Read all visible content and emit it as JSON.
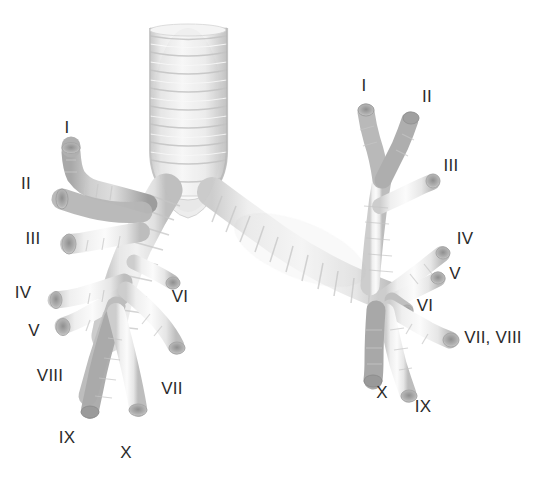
{
  "figure": {
    "kind": "anatomical-illustration",
    "background_color": "#ffffff",
    "label_color": "#2b2b2b",
    "airway_light": "#fdfdfd",
    "airway_mid": "#e3e3e3",
    "airway_shadow": "#b9b9b9",
    "airway_dark": "#9a9a9a"
  },
  "labels": {
    "left_lung": [
      {
        "text": "I",
        "x": 67,
        "y": 127
      },
      {
        "text": "II",
        "x": 26,
        "y": 183
      },
      {
        "text": "III",
        "x": 33,
        "y": 238
      },
      {
        "text": "IV",
        "x": 23,
        "y": 292
      },
      {
        "text": "V",
        "x": 34,
        "y": 330
      },
      {
        "text": "VI",
        "x": 180,
        "y": 296
      },
      {
        "text": "VII",
        "x": 172,
        "y": 388
      },
      {
        "text": "VIII",
        "x": 50,
        "y": 375
      },
      {
        "text": "IX",
        "x": 67,
        "y": 437
      },
      {
        "text": "X",
        "x": 126,
        "y": 452
      }
    ],
    "right_lung": [
      {
        "text": "I",
        "x": 364,
        "y": 85
      },
      {
        "text": "II",
        "x": 427,
        "y": 96
      },
      {
        "text": "III",
        "x": 451,
        "y": 165
      },
      {
        "text": "IV",
        "x": 465,
        "y": 238
      },
      {
        "text": "V",
        "x": 455,
        "y": 273
      },
      {
        "text": "VI",
        "x": 425,
        "y": 305
      },
      {
        "text": "VII, VIII",
        "x": 493,
        "y": 337
      },
      {
        "text": "IX",
        "x": 423,
        "y": 406
      },
      {
        "text": "X",
        "x": 382,
        "y": 392
      }
    ]
  }
}
